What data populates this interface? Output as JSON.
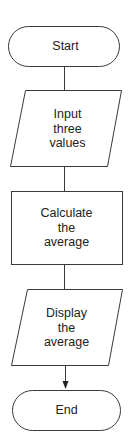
{
  "flowchart": {
    "nodes": [
      {
        "id": "start",
        "type": "terminal",
        "lines": [
          "Start"
        ]
      },
      {
        "id": "input",
        "type": "io",
        "lines": [
          "Input",
          "three",
          "values"
        ]
      },
      {
        "id": "process",
        "type": "process",
        "lines": [
          "Calculate",
          "the",
          "average"
        ]
      },
      {
        "id": "output",
        "type": "io",
        "lines": [
          "Display",
          "the",
          "average"
        ]
      },
      {
        "id": "end",
        "type": "terminal",
        "lines": [
          "End"
        ]
      }
    ],
    "edges": [
      {
        "from": "start",
        "to": "input",
        "arrow": false
      },
      {
        "from": "input",
        "to": "process",
        "arrow": false
      },
      {
        "from": "process",
        "to": "output",
        "arrow": false
      },
      {
        "from": "output",
        "to": "end",
        "arrow": true
      }
    ],
    "colors": {
      "stroke": "#3a3a3a",
      "text": "#222222",
      "background": "#ffffff"
    }
  }
}
